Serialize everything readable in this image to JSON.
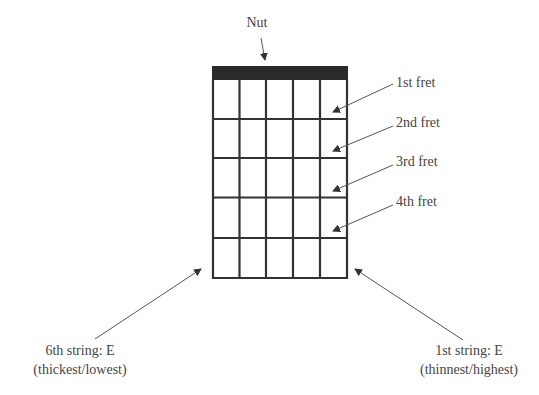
{
  "diagram": {
    "nut_label": "Nut",
    "fret_labels": [
      "1st fret",
      "2nd fret",
      "3rd fret",
      "4th fret"
    ],
    "string_left": {
      "line1": "6th string: E",
      "line2": "(thickest/lowest)"
    },
    "string_right": {
      "line1": "1st string: E",
      "line2": "(thinnest/highest)"
    },
    "strings": 6,
    "frets_shown": 5,
    "colors": {
      "grid": "#333333",
      "nut": "#2a2a2a",
      "arrow": "#555555",
      "text": "#444444"
    }
  }
}
